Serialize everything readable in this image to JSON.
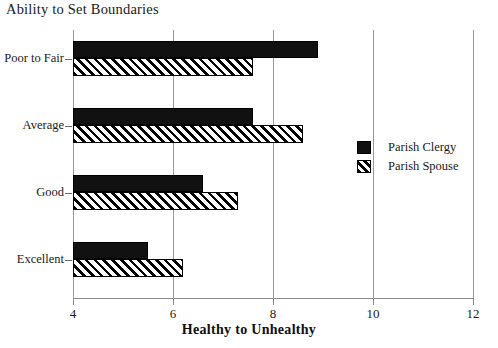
{
  "chart_data": {
    "type": "bar",
    "orientation": "horizontal",
    "title": "Ability to Set Boundaries",
    "xlabel": "Healthy to Unhealthy",
    "ylabel": "",
    "categories": [
      "Poor to Fair",
      "Average",
      "Good",
      "Excellent"
    ],
    "series": [
      {
        "name": "Parish Clergy",
        "style": "solid-black",
        "values": [
          8.9,
          7.6,
          6.6,
          5.5
        ]
      },
      {
        "name": "Parish Spouse",
        "style": "diagonal-hatch",
        "values": [
          7.6,
          8.6,
          7.3,
          6.2
        ]
      }
    ],
    "xlim": [
      4,
      12
    ],
    "xticks": [
      4,
      6,
      8,
      10,
      12
    ],
    "xticklabels": [
      "4",
      "6",
      "8",
      "10",
      "12"
    ],
    "grid": "vertical-gridlines-at-xticks",
    "legend": {
      "position": "right-middle",
      "entries": [
        "Parish Clergy",
        "Parish Spouse"
      ]
    }
  },
  "legend": {
    "entries": [
      {
        "label": "Parish Clergy",
        "swatch": "solid-black-swatch"
      },
      {
        "label": "Parish Spouse",
        "swatch": "hatched-swatch"
      }
    ]
  },
  "colors": {
    "series_clergy": "#111111",
    "series_spouse_fill": "#ffffff",
    "series_spouse_hatch": "#000000",
    "axis": "#8c8c8c",
    "gridline": "#9a9a9a",
    "text": "#1a1a1a",
    "background": "#ffffff"
  }
}
